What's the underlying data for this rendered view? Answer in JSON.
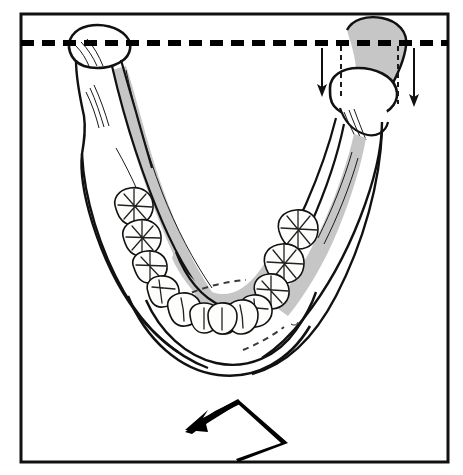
{
  "figure": {
    "title": "Mandible — occlusal view showing unilateral condylar inferior displacement",
    "view": "superior (occlusal) view of the mandible",
    "frame": {
      "label": "figure-border",
      "x": 21,
      "y": 14,
      "width": 427,
      "height": 448,
      "stroke_color": "#111111",
      "stroke_width": 3
    },
    "background_color": "#ffffff",
    "line_color": "#111111",
    "shade_color": "#c6c6c6"
  },
  "reference_line": {
    "name": "horizontal reference line",
    "description": "thick dashed horizontal datum through the condylar heads",
    "y": 43,
    "x_start": 21,
    "x_end": 448,
    "stroke_width": 6,
    "dash_length": 13,
    "gap_length": 8,
    "color": "#000000"
  },
  "condyles": [
    {
      "side": "left",
      "name": "left-condyle",
      "status": "normal position",
      "at_reference_line": true,
      "shaded": false,
      "center_x": 95,
      "center_y": 46
    },
    {
      "side": "right",
      "name": "right-condyle",
      "status": "displaced inferiorly",
      "at_reference_line": false,
      "shaded": true,
      "original_outline_shaded": true,
      "center_x": 370,
      "center_y": 48,
      "displaced_center_x": 368,
      "displaced_center_y": 100,
      "displacement_px": 52
    }
  ],
  "displacement_arrows": [
    {
      "name": "displacement-arrow-medial",
      "direction": "down",
      "x": 322,
      "y_start": 48,
      "y_end": 96,
      "stroke_width": 2
    },
    {
      "name": "displacement-arrow-lateral",
      "direction": "down",
      "x": 414,
      "y_start": 48,
      "y_end": 106,
      "stroke_width": 2
    }
  ],
  "guide_lines": [
    {
      "name": "guide-dash-medial",
      "orientation": "vertical",
      "x": 341,
      "y_start": 46,
      "y_end": 100,
      "style": "dashed"
    },
    {
      "name": "guide-dash-lateral",
      "orientation": "vertical",
      "x": 398,
      "y_start": 46,
      "y_end": 104,
      "style": "dashed"
    }
  ],
  "shift_arrow": {
    "name": "mandibular-shift-arrow",
    "shape": "bent chevron arrow",
    "direction": "down-left",
    "description": "bent arrow beneath the mandible indicating the direction of mandibular shift toward the displaced side",
    "tip_x": 185,
    "tip_y": 430,
    "color": "#000000"
  },
  "anatomy": {
    "ramus": {
      "left": {
        "name": "left-ramus",
        "shaded_inner_surface": true
      },
      "right": {
        "name": "right-ramus",
        "shaded_inner_surface": true
      }
    },
    "body": {
      "name": "mandibular-body",
      "shaded_inner_surface": true
    },
    "coronoid_process": {
      "left": "present",
      "right": "present"
    },
    "mylohyoid_line": {
      "name": "mylohyoid-line",
      "style": "thin dashed",
      "sides": [
        "left",
        "right"
      ]
    },
    "symphysis": {
      "name": "mandibular-symphysis",
      "location": "anterior midline"
    }
  },
  "dentition": {
    "arch": "mandibular dental arch",
    "total_teeth_drawn": 16,
    "quadrants": [
      {
        "side": "left",
        "teeth": [
          {
            "name": "molar",
            "type": "molar",
            "cusp_pattern": "cross"
          },
          {
            "name": "molar",
            "type": "molar",
            "cusp_pattern": "cross"
          },
          {
            "name": "premolar",
            "type": "premolar",
            "cusp_pattern": "cross"
          },
          {
            "name": "premolar",
            "type": "premolar",
            "cusp_pattern": "simple"
          },
          {
            "name": "canine",
            "type": "canine",
            "cusp_pattern": "ridge"
          },
          {
            "name": "lateral-incisor",
            "type": "incisor",
            "cusp_pattern": "flat"
          },
          {
            "name": "central-incisor",
            "type": "incisor",
            "cusp_pattern": "flat"
          }
        ]
      },
      {
        "side": "right",
        "teeth": [
          {
            "name": "molar",
            "type": "molar",
            "cusp_pattern": "cross"
          },
          {
            "name": "molar",
            "type": "molar",
            "cusp_pattern": "cross"
          },
          {
            "name": "premolar",
            "type": "premolar",
            "cusp_pattern": "cross"
          },
          {
            "name": "premolar",
            "type": "premolar",
            "cusp_pattern": "simple"
          },
          {
            "name": "canine",
            "type": "canine",
            "cusp_pattern": "ridge"
          },
          {
            "name": "lateral-incisor",
            "type": "incisor",
            "cusp_pattern": "flat"
          },
          {
            "name": "central-incisor",
            "type": "incisor",
            "cusp_pattern": "flat"
          }
        ]
      }
    ]
  },
  "labels": {
    "text_labels_present": false,
    "caption": ""
  }
}
